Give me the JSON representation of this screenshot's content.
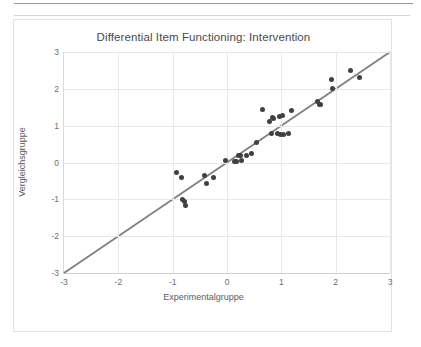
{
  "chart_data": {
    "type": "scatter",
    "title": "Differential Item Functioning: Intervention",
    "xlabel": "Experimentalgruppe",
    "ylabel": "Vergleichsgruppe",
    "xlim": [
      -3,
      3
    ],
    "ylim": [
      -3,
      3
    ],
    "xticks": [
      "-3",
      "-2",
      "-1",
      "0",
      "1",
      "2",
      "3"
    ],
    "yticks": [
      "3",
      "2",
      "1",
      "0",
      "-1",
      "-2",
      "-3"
    ],
    "xtick_values": [
      -3,
      -2,
      -1,
      0,
      1,
      2,
      3
    ],
    "ytick_values": [
      3,
      2,
      1,
      0,
      -1,
      -2,
      -3
    ],
    "grid": true,
    "legend": "none",
    "marker_color": "#404040",
    "reference_line": {
      "label": "identity line",
      "color": "#808080",
      "from": [
        -3,
        -3
      ],
      "to": [
        3,
        3
      ],
      "slope": 1,
      "intercept": 0
    },
    "points": [
      {
        "x": -0.93,
        "y": -0.26
      },
      {
        "x": -0.84,
        "y": -0.42
      },
      {
        "x": -0.81,
        "y": -1.0
      },
      {
        "x": -0.79,
        "y": -1.05
      },
      {
        "x": -0.76,
        "y": -1.18
      },
      {
        "x": -0.41,
        "y": -0.35
      },
      {
        "x": -0.38,
        "y": -0.58
      },
      {
        "x": -0.25,
        "y": -0.4
      },
      {
        "x": -0.02,
        "y": 0.06
      },
      {
        "x": 0.14,
        "y": 0.02
      },
      {
        "x": 0.17,
        "y": 0.04
      },
      {
        "x": 0.21,
        "y": 0.18
      },
      {
        "x": 0.24,
        "y": 0.19
      },
      {
        "x": 0.27,
        "y": 0.06
      },
      {
        "x": 0.35,
        "y": 0.2
      },
      {
        "x": 0.45,
        "y": 0.25
      },
      {
        "x": 0.55,
        "y": 0.53
      },
      {
        "x": 0.65,
        "y": 1.45
      },
      {
        "x": 0.78,
        "y": 1.1
      },
      {
        "x": 0.81,
        "y": 0.78
      },
      {
        "x": 0.84,
        "y": 1.22
      },
      {
        "x": 0.86,
        "y": 1.2
      },
      {
        "x": 0.93,
        "y": 0.79
      },
      {
        "x": 0.97,
        "y": 1.25
      },
      {
        "x": 0.99,
        "y": 0.75
      },
      {
        "x": 1.02,
        "y": 1.27
      },
      {
        "x": 1.04,
        "y": 0.76
      },
      {
        "x": 1.14,
        "y": 0.79
      },
      {
        "x": 1.18,
        "y": 1.42
      },
      {
        "x": 1.67,
        "y": 1.66
      },
      {
        "x": 1.7,
        "y": 1.58
      },
      {
        "x": 1.72,
        "y": 1.57
      },
      {
        "x": 1.93,
        "y": 2.24
      },
      {
        "x": 1.95,
        "y": 2.0
      },
      {
        "x": 2.28,
        "y": 2.5
      },
      {
        "x": 2.44,
        "y": 2.3
      }
    ]
  }
}
